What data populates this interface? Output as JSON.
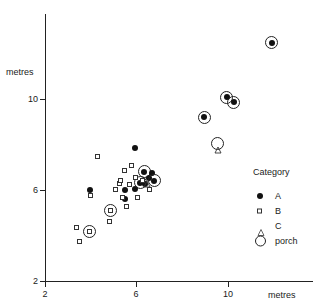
{
  "chart_data": {
    "type": "scatter",
    "title": "",
    "xlabel": "metres",
    "ylabel": "metres",
    "xlim": [
      2,
      12
    ],
    "ylim": [
      2,
      12.6
    ],
    "xticks": [
      2,
      6,
      10
    ],
    "yticks": [
      2,
      6,
      10
    ],
    "xticklabels": [
      "2",
      "6",
      "10"
    ],
    "yticklabels": [
      "2",
      "6",
      "10"
    ],
    "grid": false,
    "legend_position": "right-lower",
    "legend_title": "Category",
    "series": [
      {
        "name": "A",
        "marker": "filled-circle",
        "points": [
          {
            "x": 3.96,
            "y": 6.0,
            "porch": false
          },
          {
            "x": 5.52,
            "y": 6.0,
            "porch": false
          },
          {
            "x": 5.52,
            "y": 5.61,
            "porch": false
          },
          {
            "x": 5.96,
            "y": 6.04,
            "porch": false
          },
          {
            "x": 5.96,
            "y": 7.83,
            "porch": false
          },
          {
            "x": 6.17,
            "y": 6.3,
            "porch": true
          },
          {
            "x": 6.39,
            "y": 6.26,
            "porch": false
          },
          {
            "x": 6.35,
            "y": 6.78,
            "porch": true
          },
          {
            "x": 6.57,
            "y": 6.52,
            "porch": false
          },
          {
            "x": 6.7,
            "y": 6.74,
            "porch": false
          },
          {
            "x": 6.78,
            "y": 6.39,
            "porch": true
          },
          {
            "x": 8.96,
            "y": 9.17,
            "porch": true
          },
          {
            "x": 9.96,
            "y": 10.04,
            "porch": true
          },
          {
            "x": 10.26,
            "y": 9.83,
            "porch": true
          },
          {
            "x": 11.92,
            "y": 12.43,
            "porch": true
          }
        ]
      },
      {
        "name": "B",
        "marker": "open-square",
        "points": [
          {
            "x": 3.39,
            "y": 4.35,
            "porch": false
          },
          {
            "x": 3.52,
            "y": 3.74,
            "porch": false
          },
          {
            "x": 3.96,
            "y": 4.17,
            "porch": true
          },
          {
            "x": 4.0,
            "y": 5.74,
            "porch": false
          },
          {
            "x": 4.3,
            "y": 7.43,
            "porch": false
          },
          {
            "x": 4.83,
            "y": 4.61,
            "porch": false
          },
          {
            "x": 4.87,
            "y": 5.09,
            "porch": true
          },
          {
            "x": 5.09,
            "y": 6.0,
            "porch": false
          },
          {
            "x": 5.26,
            "y": 6.26,
            "porch": false
          },
          {
            "x": 5.3,
            "y": 6.39,
            "porch": false
          },
          {
            "x": 5.39,
            "y": 5.65,
            "porch": false
          },
          {
            "x": 5.48,
            "y": 6.83,
            "porch": false
          },
          {
            "x": 5.57,
            "y": 5.26,
            "porch": false
          },
          {
            "x": 5.7,
            "y": 6.22,
            "porch": false
          },
          {
            "x": 5.78,
            "y": 7.04,
            "porch": false
          },
          {
            "x": 5.96,
            "y": 6.52,
            "porch": false
          },
          {
            "x": 6.04,
            "y": 5.65,
            "porch": false
          },
          {
            "x": 6.26,
            "y": 6.39,
            "porch": false
          },
          {
            "x": 6.57,
            "y": 6.0,
            "porch": false
          }
        ]
      },
      {
        "name": "C",
        "marker": "open-triangle",
        "points": [
          {
            "x": 6.48,
            "y": 6.52,
            "porch": false
          },
          {
            "x": 9.57,
            "y": 8.0,
            "porch": true
          }
        ]
      }
    ]
  },
  "axes": {
    "y_title": "metres",
    "x_title": "metres",
    "y_ticks": [
      "10",
      "6",
      "2"
    ],
    "x_ticks": [
      "2",
      "6",
      "10"
    ]
  },
  "legend": {
    "title": "Category",
    "entries": [
      {
        "label": "A",
        "marker": "filled-circle"
      },
      {
        "label": "B",
        "marker": "open-square"
      },
      {
        "label": "C",
        "marker": "open-triangle"
      },
      {
        "label": "porch",
        "marker": "large-open-circle"
      }
    ]
  }
}
